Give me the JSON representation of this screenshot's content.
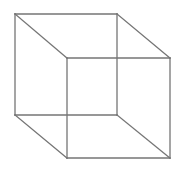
{
  "figure": {
    "name": "necker-cube",
    "type": "line-drawing",
    "canvas": {
      "width": 183,
      "height": 173,
      "background": "#ffffff"
    },
    "stroke": {
      "color": "#757575",
      "width": 1.3
    },
    "vertices": {
      "back_top_left": [
        15,
        14
      ],
      "back_top_right": [
        117,
        14
      ],
      "back_bottom_right": [
        117,
        115
      ],
      "back_bottom_left": [
        15,
        115
      ],
      "front_top_left": [
        67,
        58
      ],
      "front_top_right": [
        170,
        58
      ],
      "front_bottom_right": [
        170,
        158
      ],
      "front_bottom_left": [
        67,
        158
      ]
    },
    "edges": [
      {
        "id": "back-top",
        "label": "back square top edge",
        "points": "15,14 117,14"
      },
      {
        "id": "back-right",
        "label": "back square right edge",
        "points": "117,14 117,115"
      },
      {
        "id": "back-bottom",
        "label": "back square bottom edge",
        "points": "117,115 15,115"
      },
      {
        "id": "back-left",
        "label": "back square left edge",
        "points": "15,115 15,14"
      },
      {
        "id": "front-top",
        "label": "front square top edge",
        "points": "67,58 170,58"
      },
      {
        "id": "front-right",
        "label": "front square right edge",
        "points": "170,58 170,158"
      },
      {
        "id": "front-bottom",
        "label": "front square bottom edge",
        "points": "170,158 67,158"
      },
      {
        "id": "front-left",
        "label": "front square left edge",
        "points": "67,158 67,58"
      },
      {
        "id": "connector-top-left",
        "label": "top left connecting edge",
        "points": "15,14 67,58"
      },
      {
        "id": "connector-top-right",
        "label": "top right connecting edge",
        "points": "117,14 170,58"
      },
      {
        "id": "connector-bottom-right",
        "label": "bottom right connecting edge",
        "points": "117,115 170,158"
      },
      {
        "id": "connector-bottom-left",
        "label": "bottom left connecting edge",
        "points": "15,115 67,158"
      }
    ]
  }
}
